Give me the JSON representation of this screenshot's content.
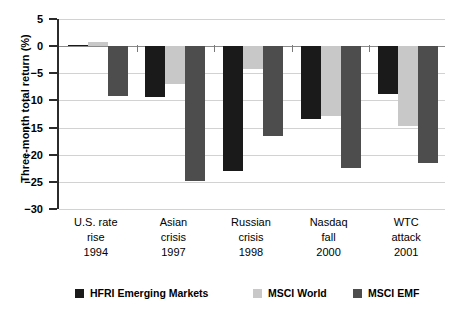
{
  "chart_data": {
    "type": "bar",
    "title": "",
    "xlabel": "",
    "ylabel": "Three-month total return (%)",
    "ylim": [
      -30,
      5
    ],
    "yticks": [
      5,
      0,
      -5,
      -10,
      -15,
      -20,
      -25,
      -30
    ],
    "ytick_labels": [
      "5",
      "0",
      "−5",
      "−10",
      "−15",
      "−20",
      "−25",
      "−30"
    ],
    "grid": true,
    "legend_position": "bottom",
    "categories": [
      "U.S. rate rise 1994",
      "Asian crisis 1997",
      "Russian crisis 1998",
      "Nasdaq fall 2000",
      "WTC attack 2001"
    ],
    "category_lines": [
      [
        "U.S. rate",
        "rise",
        "1994"
      ],
      [
        "Asian",
        "crisis",
        "1997"
      ],
      [
        "Russian",
        "crisis",
        "1998"
      ],
      [
        "Nasdaq",
        "fall",
        "2000"
      ],
      [
        "WTC",
        "attack",
        "2001"
      ]
    ],
    "series": [
      {
        "name": "HFRI Emerging Markets",
        "color": "#1a1a1a",
        "values": [
          0.3,
          -9.3,
          -23.0,
          -13.5,
          -8.8
        ]
      },
      {
        "name": "MSCI World",
        "color": "#c8c8c8",
        "values": [
          0.8,
          -6.9,
          -4.2,
          -12.8,
          -14.8
        ]
      },
      {
        "name": "MSCI EMF",
        "color": "#4d4d4d",
        "values": [
          -9.2,
          -24.8,
          -16.5,
          -22.5,
          -21.5
        ]
      }
    ]
  },
  "legend": {
    "items": [
      {
        "label": "HFRI Emerging Markets",
        "color": "#1a1a1a"
      },
      {
        "label": "MSCI World",
        "color": "#c8c8c8"
      },
      {
        "label": "MSCI EMF",
        "color": "#4d4d4d"
      }
    ]
  },
  "axis": {
    "y_title": "Three-month total return (%)"
  },
  "colors": {
    "series_black": "#1a1a1a",
    "series_light_gray": "#c8c8c8",
    "series_dark_gray": "#4d4d4d",
    "grid": "#d2d2d2",
    "axis": "#2b2b2b",
    "background": "#ffffff"
  }
}
